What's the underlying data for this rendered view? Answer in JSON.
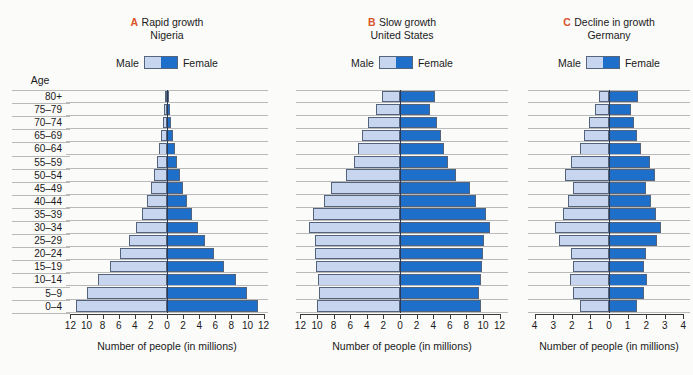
{
  "page": {
    "top_trimmed_text": "",
    "background": "#fbfbf9",
    "male_color": "#c7d5ee",
    "female_color": "#1d6fc9",
    "letter_color": "#d9542b",
    "gridline_color": "#b9b9b9"
  },
  "age_axis": {
    "title": "Age",
    "groups": [
      "80+",
      "75–79",
      "70–74",
      "65–69",
      "60–64",
      "55–59",
      "50–54",
      "45–49",
      "40–44",
      "35–39",
      "30–34",
      "25–29",
      "20–24",
      "15–19",
      "10–14",
      "5–9",
      "0–4"
    ]
  },
  "legend": {
    "male_label": "Male",
    "female_label": "Female"
  },
  "chart_data": [
    {
      "type": "bar",
      "id": "nigeria",
      "letter": "A",
      "title": "Rapid growth",
      "subtitle": "Nigeria",
      "xlabel": "Number of people (in millions)",
      "ylabel": "Age",
      "categories": [
        "80+",
        "75–79",
        "70–74",
        "65–69",
        "60–64",
        "55–59",
        "50–54",
        "45–49",
        "40–44",
        "35–39",
        "30–34",
        "25–29",
        "20–24",
        "15–19",
        "10–14",
        "5–9",
        "0–4"
      ],
      "xlim": [
        -12,
        12
      ],
      "ticks": [
        12,
        10,
        8,
        6,
        4,
        2,
        0,
        2,
        4,
        6,
        8,
        10,
        12
      ],
      "grid": true,
      "legend_position": "top-center",
      "series": [
        {
          "name": "Male",
          "values": [
            0.25,
            0.35,
            0.5,
            0.7,
            0.95,
            1.25,
            1.6,
            2.0,
            2.5,
            3.1,
            3.8,
            4.7,
            5.8,
            7.1,
            8.6,
            9.9,
            11.3
          ]
        },
        {
          "name": "Female",
          "values": [
            0.25,
            0.35,
            0.5,
            0.7,
            0.95,
            1.25,
            1.6,
            2.0,
            2.5,
            3.1,
            3.8,
            4.7,
            5.8,
            7.1,
            8.6,
            9.9,
            11.3
          ]
        }
      ]
    },
    {
      "type": "bar",
      "id": "united-states",
      "letter": "B",
      "title": "Slow growth",
      "subtitle": "United States",
      "xlabel": "Number of people (in millions)",
      "ylabel": "Age",
      "categories": [
        "80+",
        "75–79",
        "70–74",
        "65–69",
        "60–64",
        "55–59",
        "50–54",
        "45–49",
        "40–44",
        "35–39",
        "30–34",
        "25–29",
        "20–24",
        "15–19",
        "10–14",
        "5–9",
        "0–4"
      ],
      "xlim": [
        -12,
        12
      ],
      "ticks": [
        12,
        10,
        8,
        6,
        4,
        2,
        0,
        2,
        4,
        6,
        8,
        10,
        12
      ],
      "grid": true,
      "legend_position": "top-center",
      "series": [
        {
          "name": "Male",
          "values": [
            2.2,
            2.9,
            3.9,
            4.6,
            5.1,
            5.6,
            6.5,
            8.3,
            9.2,
            10.5,
            11.0,
            10.3,
            10.2,
            10.1,
            9.9,
            9.7,
            10.0
          ]
        },
        {
          "name": "Female",
          "values": [
            4.2,
            3.6,
            4.4,
            4.9,
            5.3,
            5.8,
            6.7,
            8.4,
            9.2,
            10.4,
            10.8,
            10.1,
            10.0,
            9.9,
            9.7,
            9.5,
            9.7
          ]
        }
      ]
    },
    {
      "type": "bar",
      "id": "germany",
      "letter": "C",
      "title": "Decline in growth",
      "subtitle": "Germany",
      "xlabel": "Number of people (in millions)",
      "ylabel": "Age",
      "categories": [
        "80+",
        "75–79",
        "70–74",
        "65–69",
        "60–64",
        "55–59",
        "50–54",
        "45–49",
        "40–44",
        "35–39",
        "30–34",
        "25–29",
        "20–24",
        "15–19",
        "10–14",
        "5–9",
        "0–4"
      ],
      "xlim": [
        -4,
        4
      ],
      "ticks": [
        4,
        3,
        2,
        1,
        0,
        1,
        2,
        3,
        4
      ],
      "grid": true,
      "legend_position": "top-center",
      "series": [
        {
          "name": "Male",
          "values": [
            0.55,
            0.75,
            1.1,
            1.35,
            1.55,
            2.05,
            2.35,
            1.95,
            2.2,
            2.45,
            2.9,
            2.7,
            2.05,
            1.95,
            2.1,
            1.95,
            1.55
          ]
        },
        {
          "name": "Female",
          "values": [
            1.55,
            1.2,
            1.35,
            1.5,
            1.7,
            2.2,
            2.45,
            2.0,
            2.25,
            2.5,
            2.8,
            2.6,
            2.0,
            1.9,
            2.05,
            1.9,
            1.5
          ]
        }
      ]
    }
  ]
}
